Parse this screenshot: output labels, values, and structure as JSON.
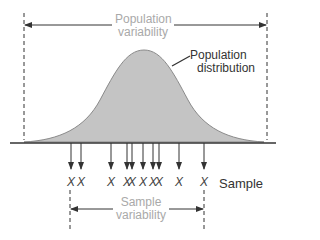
{
  "labels": {
    "population_variability_line1": "Population",
    "population_variability_line2": "variability",
    "population_distribution_line1": "Population",
    "population_distribution_line2": "distribution",
    "sample": "Sample",
    "sample_variability_line1": "Sample",
    "sample_variability_line2": "variability"
  },
  "sample_marks": [
    {
      "x": 71,
      "label": "X"
    },
    {
      "x": 81,
      "label": "X"
    },
    {
      "x": 111,
      "label": "X"
    },
    {
      "x": 127,
      "label": "X"
    },
    {
      "x": 132,
      "label": "X"
    },
    {
      "x": 143,
      "label": "X"
    },
    {
      "x": 153,
      "label": "X"
    },
    {
      "x": 159,
      "label": "X"
    },
    {
      "x": 179,
      "label": "X"
    },
    {
      "x": 204,
      "label": "X"
    }
  ],
  "colors": {
    "curve_fill": "#c4c4c4",
    "curve_stroke": "#8a8a8a",
    "line": "#333333",
    "label_gray": "#a9a9a9"
  }
}
